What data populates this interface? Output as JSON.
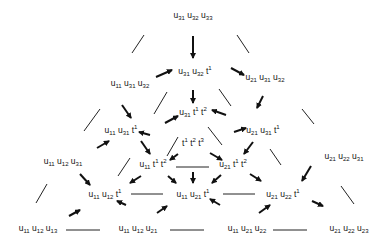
{
  "diagram": {
    "type": "poset-triangle",
    "nodes": [
      {
        "id": "n1",
        "terms": [
          {
            "b": "u",
            "s": "31"
          },
          {
            "b": "u",
            "s": "32"
          },
          {
            "b": "u",
            "s": "33"
          }
        ],
        "x": 193,
        "y": 16
      },
      {
        "id": "n2",
        "terms": [
          {
            "b": "u",
            "s": "31"
          },
          {
            "b": "u",
            "s": "32"
          },
          {
            "b": "t",
            "p": "1"
          }
        ],
        "x": 195,
        "y": 71
      },
      {
        "id": "n3",
        "terms": [
          {
            "b": "u",
            "s": "11"
          },
          {
            "b": "u",
            "s": "31"
          },
          {
            "b": "u",
            "s": "32"
          }
        ],
        "x": 130,
        "y": 84
      },
      {
        "id": "n4",
        "terms": [
          {
            "b": "u",
            "s": "21"
          },
          {
            "b": "u",
            "s": "31"
          },
          {
            "b": "u",
            "s": "32"
          }
        ],
        "x": 265,
        "y": 78
      },
      {
        "id": "n5",
        "terms": [
          {
            "b": "u",
            "s": "31"
          },
          {
            "b": "t",
            "p": "1"
          },
          {
            "b": "t",
            "p": "2"
          }
        ],
        "x": 193,
        "y": 112
      },
      {
        "id": "n6",
        "terms": [
          {
            "b": "u",
            "s": "11"
          },
          {
            "b": "u",
            "s": "31"
          },
          {
            "b": "t",
            "p": "1"
          }
        ],
        "x": 121,
        "y": 130
      },
      {
        "id": "n7",
        "terms": [
          {
            "b": "u",
            "s": "21"
          },
          {
            "b": "u",
            "s": "31"
          },
          {
            "b": "t",
            "p": "1"
          }
        ],
        "x": 263,
        "y": 130
      },
      {
        "id": "n8",
        "terms": [
          {
            "b": "t",
            "p": "1"
          },
          {
            "b": "t",
            "p": "2"
          },
          {
            "b": "t",
            "p": "3"
          }
        ],
        "x": 193,
        "y": 142
      },
      {
        "id": "n9",
        "terms": [
          {
            "b": "u",
            "s": "11"
          },
          {
            "b": "u",
            "s": "12"
          },
          {
            "b": "u",
            "s": "31"
          }
        ],
        "x": 63,
        "y": 162
      },
      {
        "id": "n10",
        "terms": [
          {
            "b": "u",
            "s": "11"
          },
          {
            "b": "t",
            "p": "1"
          },
          {
            "b": "t",
            "p": "2"
          }
        ],
        "x": 153,
        "y": 164
      },
      {
        "id": "n11",
        "terms": [
          {
            "b": "u",
            "s": "21"
          },
          {
            "b": "t",
            "p": "1"
          },
          {
            "b": "t",
            "p": "2"
          }
        ],
        "x": 233,
        "y": 164
      },
      {
        "id": "n12",
        "terms": [
          {
            "b": "u",
            "s": "21"
          },
          {
            "b": "u",
            "s": "22"
          },
          {
            "b": "u",
            "s": "31"
          }
        ],
        "x": 344,
        "y": 157
      },
      {
        "id": "n13",
        "terms": [
          {
            "b": "u",
            "s": "11"
          },
          {
            "b": "u",
            "s": "12"
          },
          {
            "b": "t",
            "p": "1"
          }
        ],
        "x": 105,
        "y": 194
      },
      {
        "id": "n14",
        "terms": [
          {
            "b": "u",
            "s": "11"
          },
          {
            "b": "u",
            "s": "21"
          },
          {
            "b": "t",
            "p": "1"
          }
        ],
        "x": 193,
        "y": 194
      },
      {
        "id": "n15",
        "terms": [
          {
            "b": "u",
            "s": "21"
          },
          {
            "b": "u",
            "s": "22"
          },
          {
            "b": "t",
            "p": "1"
          }
        ],
        "x": 283,
        "y": 194
      },
      {
        "id": "n16",
        "terms": [
          {
            "b": "u",
            "s": "11"
          },
          {
            "b": "u",
            "s": "12"
          },
          {
            "b": "u",
            "s": "13"
          }
        ],
        "x": 38,
        "y": 229
      },
      {
        "id": "n17",
        "terms": [
          {
            "b": "u",
            "s": "11"
          },
          {
            "b": "u",
            "s": "12"
          },
          {
            "b": "u",
            "s": "21"
          }
        ],
        "x": 138,
        "y": 229
      },
      {
        "id": "n18",
        "terms": [
          {
            "b": "u",
            "s": "11"
          },
          {
            "b": "u",
            "s": "21"
          },
          {
            "b": "u",
            "s": "22"
          }
        ],
        "x": 247,
        "y": 229
      },
      {
        "id": "n19",
        "terms": [
          {
            "b": "u",
            "s": "21"
          },
          {
            "b": "u",
            "s": "22"
          },
          {
            "b": "u",
            "s": "23"
          }
        ],
        "x": 349,
        "y": 229
      }
    ],
    "arrows": [
      {
        "x1": 193,
        "y1": 36,
        "x2": 193,
        "y2": 58
      },
      {
        "x1": 156,
        "y1": 77,
        "x2": 172,
        "y2": 70
      },
      {
        "x1": 231,
        "y1": 68,
        "x2": 244,
        "y2": 75
      },
      {
        "x1": 193,
        "y1": 90,
        "x2": 193,
        "y2": 103
      },
      {
        "x1": 122,
        "y1": 105,
        "x2": 131,
        "y2": 118
      },
      {
        "x1": 165,
        "y1": 123,
        "x2": 178,
        "y2": 116
      },
      {
        "x1": 226,
        "y1": 115,
        "x2": 212,
        "y2": 110
      },
      {
        "x1": 263,
        "y1": 96,
        "x2": 257,
        "y2": 108
      },
      {
        "x1": 234,
        "y1": 132,
        "x2": 246,
        "y2": 128
      },
      {
        "x1": 150,
        "y1": 135,
        "x2": 139,
        "y2": 132
      },
      {
        "x1": 97,
        "y1": 148,
        "x2": 109,
        "y2": 141
      },
      {
        "x1": 141,
        "y1": 141,
        "x2": 150,
        "y2": 154
      },
      {
        "x1": 178,
        "y1": 154,
        "x2": 170,
        "y2": 160
      },
      {
        "x1": 210,
        "y1": 153,
        "x2": 222,
        "y2": 160
      },
      {
        "x1": 253,
        "y1": 142,
        "x2": 244,
        "y2": 154
      },
      {
        "x1": 80,
        "y1": 174,
        "x2": 90,
        "y2": 185
      },
      {
        "x1": 141,
        "y1": 176,
        "x2": 130,
        "y2": 183
      },
      {
        "x1": 168,
        "y1": 176,
        "x2": 176,
        "y2": 183
      },
      {
        "x1": 193,
        "y1": 172,
        "x2": 193,
        "y2": 183
      },
      {
        "x1": 221,
        "y1": 175,
        "x2": 212,
        "y2": 183
      },
      {
        "x1": 250,
        "y1": 174,
        "x2": 261,
        "y2": 181
      },
      {
        "x1": 311,
        "y1": 166,
        "x2": 302,
        "y2": 181
      },
      {
        "x1": 69,
        "y1": 216,
        "x2": 80,
        "y2": 210
      },
      {
        "x1": 126,
        "y1": 205,
        "x2": 117,
        "y2": 201
      },
      {
        "x1": 157,
        "y1": 213,
        "x2": 167,
        "y2": 206
      },
      {
        "x1": 220,
        "y1": 205,
        "x2": 210,
        "y2": 199
      },
      {
        "x1": 259,
        "y1": 213,
        "x2": 270,
        "y2": 205
      },
      {
        "x1": 312,
        "y1": 201,
        "x2": 323,
        "y2": 206
      }
    ],
    "lines": [
      {
        "x1": 144,
        "y1": 35,
        "x2": 132,
        "y2": 53
      },
      {
        "x1": 237,
        "y1": 35,
        "x2": 249,
        "y2": 53
      },
      {
        "x1": 167,
        "y1": 92,
        "x2": 154,
        "y2": 114
      },
      {
        "x1": 219,
        "y1": 89,
        "x2": 231,
        "y2": 106
      },
      {
        "x1": 100,
        "y1": 109,
        "x2": 84,
        "y2": 131
      },
      {
        "x1": 178,
        "y1": 137,
        "x2": 167,
        "y2": 156
      },
      {
        "x1": 208,
        "y1": 127,
        "x2": 222,
        "y2": 145
      },
      {
        "x1": 302,
        "y1": 109,
        "x2": 314,
        "y2": 124
      },
      {
        "x1": 130,
        "y1": 158,
        "x2": 118,
        "y2": 176
      },
      {
        "x1": 270,
        "y1": 149,
        "x2": 281,
        "y2": 165
      },
      {
        "x1": 47,
        "y1": 184,
        "x2": 36,
        "y2": 203
      },
      {
        "x1": 341,
        "y1": 186,
        "x2": 354,
        "y2": 204
      },
      {
        "x1": 176,
        "y1": 167,
        "x2": 209,
        "y2": 167
      },
      {
        "x1": 131,
        "y1": 194,
        "x2": 163,
        "y2": 194
      },
      {
        "x1": 223,
        "y1": 194,
        "x2": 255,
        "y2": 194
      },
      {
        "x1": 66,
        "y1": 230,
        "x2": 100,
        "y2": 230
      },
      {
        "x1": 170,
        "y1": 230,
        "x2": 204,
        "y2": 230
      },
      {
        "x1": 273,
        "y1": 230,
        "x2": 307,
        "y2": 230
      }
    ]
  }
}
